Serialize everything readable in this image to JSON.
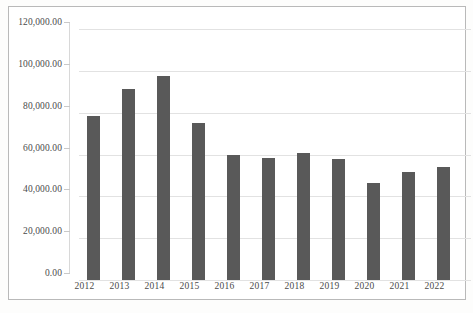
{
  "chart_data": {
    "type": "bar",
    "title": "",
    "xlabel": "",
    "ylabel": "",
    "categories": [
      "2012",
      "2013",
      "2014",
      "2015",
      "2016",
      "2017",
      "2018",
      "2019",
      "2020",
      "2021",
      "2022"
    ],
    "values": [
      78500,
      91500,
      97500,
      75000,
      59800,
      58500,
      60800,
      57800,
      46200,
      51500,
      54200
    ],
    "ylim": [
      0,
      120000
    ],
    "y_ticks": [
      0,
      20000,
      40000,
      60000,
      80000,
      100000,
      120000
    ],
    "y_tick_labels": [
      "0.00",
      "20,000.00",
      "40,000.00",
      "60,000.00",
      "80,000.00",
      "100,000.00",
      "120,000.00"
    ],
    "grid": true,
    "legend": "none",
    "series": [
      {
        "name": "",
        "values": [
          78500,
          91500,
          97500,
          75000,
          59800,
          58500,
          60800,
          57800,
          46200,
          51500,
          54200
        ]
      }
    ]
  },
  "style": {
    "bar_color": "#595959",
    "grid_color": "#e2e2e2",
    "axis_text_color": "#4a4a4a",
    "frame_color": "#b9b9b9",
    "background": "#ffffff"
  }
}
